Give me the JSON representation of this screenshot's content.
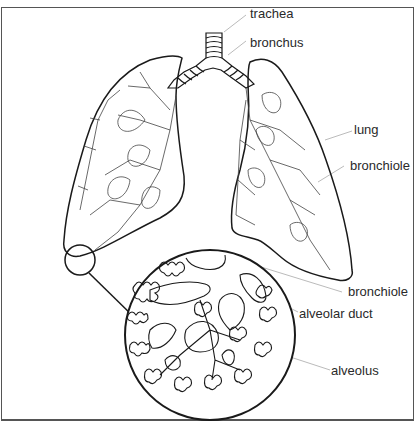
{
  "diagram": {
    "labels": {
      "trachea": "trachea",
      "bronchus": "bronchus",
      "lung": "lung",
      "bronchiole_upper": "bronchiole",
      "bronchiole_lower": "bronchiole",
      "alveolar_duct": "alveolar duct",
      "alveolus": "alveolus"
    },
    "colors": {
      "outline": "#1a1a1a",
      "leader_line": "#bbbbbb",
      "text": "#2a2a2a",
      "background": "#ffffff"
    }
  }
}
